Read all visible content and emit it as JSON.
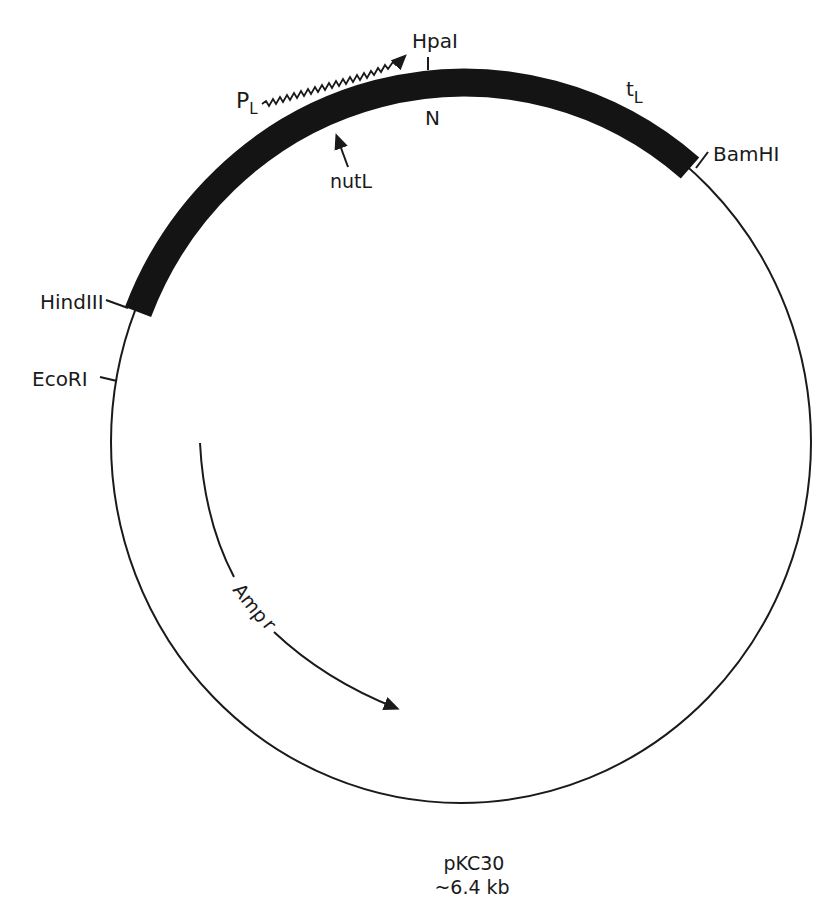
{
  "diagram": {
    "type": "plasmid-map",
    "plasmid_name": "pKC30",
    "plasmid_size": "~6.4 kb",
    "colors": {
      "ink": "#1a1a1a",
      "background": "#ffffff"
    },
    "restriction_sites": [
      {
        "id": "hpai",
        "name": "HpaI"
      },
      {
        "id": "bamhi",
        "name": "BamHI"
      },
      {
        "id": "hindiii",
        "name": "HindIII"
      },
      {
        "id": "ecori",
        "name": "EcoRI"
      }
    ],
    "features": {
      "promoter": {
        "main": "P",
        "sub": "L"
      },
      "terminator": {
        "main": "t",
        "sub": "L"
      },
      "gene_n": "N",
      "nut_site": "nutL",
      "resistance": {
        "main": "Amp",
        "sup": "r"
      }
    }
  }
}
